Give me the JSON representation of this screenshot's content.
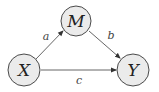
{
  "diagram": {
    "type": "mediation-path-diagram",
    "nodes": [
      {
        "id": "M",
        "label": "M",
        "cx": 76,
        "cy": 21,
        "r": 15
      },
      {
        "id": "X",
        "label": "X",
        "cx": 24,
        "cy": 70,
        "r": 16
      },
      {
        "id": "Y",
        "label": "Y",
        "cx": 133,
        "cy": 70,
        "r": 16
      }
    ],
    "edges": [
      {
        "from": "X",
        "to": "M",
        "label": "a"
      },
      {
        "from": "M",
        "to": "Y",
        "label": "b"
      },
      {
        "from": "X",
        "to": "Y",
        "label": "c"
      }
    ],
    "colors": {
      "node_fill": "#ebebeb",
      "stroke": "#4a4a4a"
    }
  }
}
